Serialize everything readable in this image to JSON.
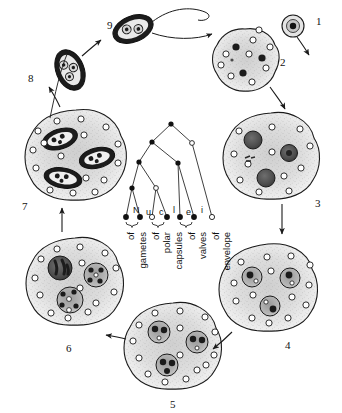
{
  "figure": {
    "type": "life-cycle-diagram",
    "background_color": "#ffffff",
    "ink_color": "#1a1a1a"
  },
  "stages": [
    {
      "id": "1",
      "label": "1",
      "label_x": 316,
      "label_y": 16,
      "cx": 293,
      "cy": 26,
      "rx": 11,
      "ry": 11,
      "kind": "small-round-cell",
      "description": "uninucleate amoeboid germ cell",
      "dark_nuclei": 1,
      "open_nuclei": 0,
      "inner_cells": 0
    },
    {
      "id": "2",
      "label": "2",
      "label_x": 280,
      "label_y": 57,
      "cx": 245,
      "cy": 60,
      "rx": 33,
      "ry": 31,
      "kind": "amoeboid-plasmodium",
      "description": "multinucleate plasmodium with generative and vegetative nuclei",
      "dark_nuclei": 4,
      "open_nuclei": 9,
      "inner_cells": 0
    },
    {
      "id": "3",
      "label": "3",
      "label_x": 315,
      "label_y": 198,
      "cx": 271,
      "cy": 155,
      "rx": 44,
      "ry": 42,
      "kind": "plasmodium-with-pansporoblasts",
      "description": "three early pansporoblasts inside plasmodium",
      "dark_nuclei": 0,
      "open_nuclei": 12,
      "inner_cells": 3
    },
    {
      "id": "4",
      "label": "4",
      "label_x": 285,
      "label_y": 340,
      "cx": 267,
      "cy": 287,
      "rx": 45,
      "ry": 42,
      "kind": "plasmodium-with-pansporoblasts",
      "description": "pansporoblasts each with a generative and an enveloping nucleus",
      "dark_nuclei": 0,
      "open_nuclei": 14,
      "inner_cells": 3
    },
    {
      "id": "5",
      "label": "5",
      "label_x": 170,
      "label_y": 399,
      "cx": 172,
      "cy": 345,
      "rx": 45,
      "ry": 42,
      "kind": "plasmodium-with-sporoblasts",
      "description": "sporoblasts with several nuclei each",
      "dark_nuclei": 0,
      "open_nuclei": 15,
      "inner_cells": 3
    },
    {
      "id": "6",
      "label": "6",
      "label_x": 66,
      "label_y": 343,
      "cx": 74,
      "cy": 280,
      "rx": 45,
      "ry": 42,
      "kind": "plasmodium-with-differentiating-sporoblasts",
      "description": "sporoblasts differentiating valve, capsule and gamete nuclei",
      "dark_nuclei": 0,
      "open_nuclei": 14,
      "inner_cells": 3
    },
    {
      "id": "7",
      "label": "7",
      "label_x": 22,
      "label_y": 201,
      "cx": 75,
      "cy": 154,
      "rx": 46,
      "ry": 43,
      "kind": "plasmodium-with-mature-spores",
      "description": "three mature spores within the plasmodium",
      "dark_nuclei": 0,
      "open_nuclei": 16,
      "inner_cells": 3
    },
    {
      "id": "8",
      "label": "8",
      "label_x": 28,
      "label_y": 73,
      "cx": 70,
      "cy": 70,
      "rx": 14,
      "ry": 21,
      "kind": "free-spore",
      "description": "released mature spore with two polar capsules",
      "dark_nuclei": 3,
      "open_nuclei": 0,
      "inner_cells": 0
    },
    {
      "id": "9",
      "label": "9",
      "label_x": 107,
      "label_y": 20,
      "cx": 133,
      "cy": 29,
      "rx": 18,
      "ry": 12,
      "kind": "germinating-spore",
      "description": "spore discharging polar filaments and releasing the amoeboid germ",
      "dark_nuclei": 2,
      "open_nuclei": 0,
      "inner_cells": 0
    }
  ],
  "cycle_arrows": [
    {
      "from": "1",
      "to": "2"
    },
    {
      "from": "2",
      "to": "3"
    },
    {
      "from": "3",
      "to": "4"
    },
    {
      "from": "4",
      "to": "5"
    },
    {
      "from": "5",
      "to": "6"
    },
    {
      "from": "6",
      "to": "7"
    },
    {
      "from": "7",
      "to": "8"
    },
    {
      "from": "8",
      "to": "9"
    },
    {
      "from": "9",
      "to": "1"
    }
  ],
  "tree": {
    "title_word": "Nuclei",
    "title_letters": [
      {
        "ch": "N",
        "x": 135,
        "y": 207
      },
      {
        "ch": "u",
        "x": 148,
        "y": 209
      },
      {
        "ch": "c",
        "x": 161,
        "y": 209
      },
      {
        "ch": "l",
        "x": 174,
        "y": 207
      },
      {
        "ch": "e",
        "x": 188,
        "y": 209
      },
      {
        "ch": "i",
        "x": 202,
        "y": 207
      }
    ],
    "node_fill_filled": "#111111",
    "node_fill_open": "#ffffff",
    "root": {
      "x": 171,
      "y": 124,
      "type": "filled"
    },
    "internal_nodes": [
      {
        "x": 152,
        "y": 142,
        "type": "filled"
      },
      {
        "x": 192,
        "y": 143,
        "type": "open"
      },
      {
        "x": 139,
        "y": 162,
        "type": "filled"
      },
      {
        "x": 178,
        "y": 163,
        "type": "filled"
      },
      {
        "x": 132,
        "y": 188,
        "type": "filled"
      },
      {
        "x": 156,
        "y": 188,
        "type": "open"
      }
    ],
    "terminal_nodes": [
      {
        "x": 126,
        "y": 217,
        "type": "filled"
      },
      {
        "x": 140,
        "y": 217,
        "type": "filled"
      },
      {
        "x": 152,
        "y": 217,
        "type": "open"
      },
      {
        "x": 167,
        "y": 217,
        "type": "filled"
      },
      {
        "x": 180,
        "y": 217,
        "type": "open"
      },
      {
        "x": 194,
        "y": 217,
        "type": "filled"
      },
      {
        "x": 212,
        "y": 217,
        "type": "open"
      }
    ],
    "braces": [
      {
        "from_x": 124,
        "to_x": 142,
        "y": 222,
        "label": "of gametes"
      },
      {
        "from_x": 150,
        "to_x": 169,
        "y": 222,
        "label": "of polar capsules"
      },
      {
        "from_x": 178,
        "to_x": 196,
        "y": 222,
        "label": "of valves"
      }
    ],
    "labels": [
      {
        "text": "of",
        "x": 131,
        "y": 228,
        "group": "gametes"
      },
      {
        "text": "gametes",
        "x": 144,
        "y": 228,
        "group": "gametes"
      },
      {
        "text": "of",
        "x": 157,
        "y": 228,
        "group": "polar capsules"
      },
      {
        "text": "polar",
        "x": 169,
        "y": 228,
        "group": "polar capsules"
      },
      {
        "text": "capsules",
        "x": 181,
        "y": 228,
        "group": "polar capsules"
      },
      {
        "text": "of",
        "x": 194,
        "y": 228,
        "group": "valves"
      },
      {
        "text": "valves",
        "x": 206,
        "y": 228,
        "group": "valves"
      },
      {
        "text": "of",
        "x": 218,
        "y": 228,
        "group": "envelope"
      },
      {
        "text": "envelope",
        "x": 230,
        "y": 228,
        "group": "envelope"
      }
    ]
  }
}
